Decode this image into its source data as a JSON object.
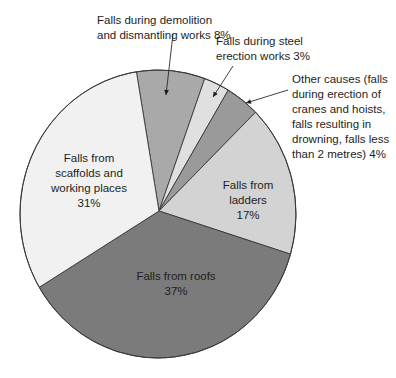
{
  "chart_data": {
    "type": "pie",
    "title": "",
    "start_slice": "Falls during demolition and dismantling works",
    "direction": "clockwise",
    "slices": [
      {
        "name": "Falls during demolition and dismantling works",
        "value": 8,
        "color": "#a9a9a9",
        "label_lines": [
          "Falls during demolition",
          "and dismantling works 8%"
        ],
        "label_style": "external-arrow"
      },
      {
        "name": "Falls during steel erection works",
        "value": 3,
        "color": "#e0e0e0",
        "label_lines": [
          "Falls during steel",
          "erection works 3%"
        ],
        "label_style": "external-arrow"
      },
      {
        "name": "Other causes (falls during erection of cranes and hoists, falls resulting in drowning, falls less than 2 metres)",
        "value": 4,
        "color": "#9a9a9a",
        "label_lines": [
          "Other causes (falls",
          "during erection of",
          "cranes and hoists,",
          "falls resulting in",
          "drowning, falls less",
          "than 2 metres) 4%"
        ],
        "label_style": "external-arrow"
      },
      {
        "name": "Falls from ladders",
        "value": 17,
        "color": "#d3d3d3",
        "label_lines": [
          "Falls from",
          "ladders",
          "17%"
        ],
        "label_style": "internal"
      },
      {
        "name": "Falls from roofs",
        "value": 37,
        "color": "#7b7b7b",
        "label_lines": [
          "Falls from roofs",
          "37%"
        ],
        "label_style": "internal"
      },
      {
        "name": "Falls from scaffolds and working places",
        "value": 31,
        "color": "#f1f1f1",
        "label_lines": [
          "Falls from",
          "scaffolds and",
          "working places",
          "31%"
        ],
        "label_style": "internal"
      }
    ],
    "unit": "%",
    "legend": "none"
  }
}
